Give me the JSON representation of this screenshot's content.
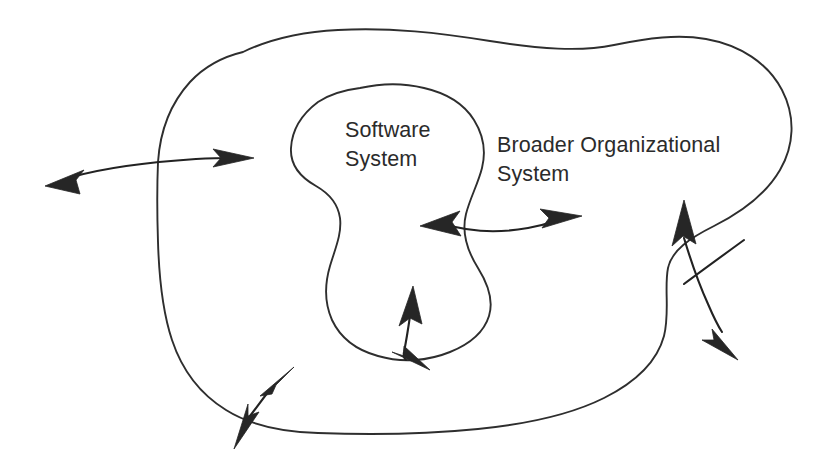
{
  "canvas": {
    "width": 832,
    "height": 471,
    "background": "#ffffff",
    "line_color": "#2e2e2e",
    "arrow_color": "#262626",
    "text_color": "#2b2b2b"
  },
  "labels": {
    "software_system": "Software\nSystem",
    "broader_organizational_system": "Broader Organizational\nSystem"
  },
  "shapes": [
    {
      "name": "broader-organizational-system-boundary",
      "role": "outer closed freeform boundary"
    },
    {
      "name": "software-system-boundary",
      "role": "inner closed freeform boundary"
    }
  ],
  "arrows": [
    {
      "name": "left-external-interaction-arrow",
      "style": "double-headed",
      "crosses": "outer boundary, left side"
    },
    {
      "name": "center-internal-interaction-arrow",
      "style": "double-headed",
      "crosses": "inner boundary, right side"
    },
    {
      "name": "bottom-center-internal-interaction-arrow",
      "style": "double-headed",
      "crosses": "inner boundary, bottom"
    },
    {
      "name": "bottom-left-external-interaction-arrow",
      "style": "double-headed",
      "crosses": "outer boundary, bottom left"
    },
    {
      "name": "right-external-interaction-arrow",
      "style": "double-headed",
      "crosses": "outer boundary, right side"
    }
  ]
}
